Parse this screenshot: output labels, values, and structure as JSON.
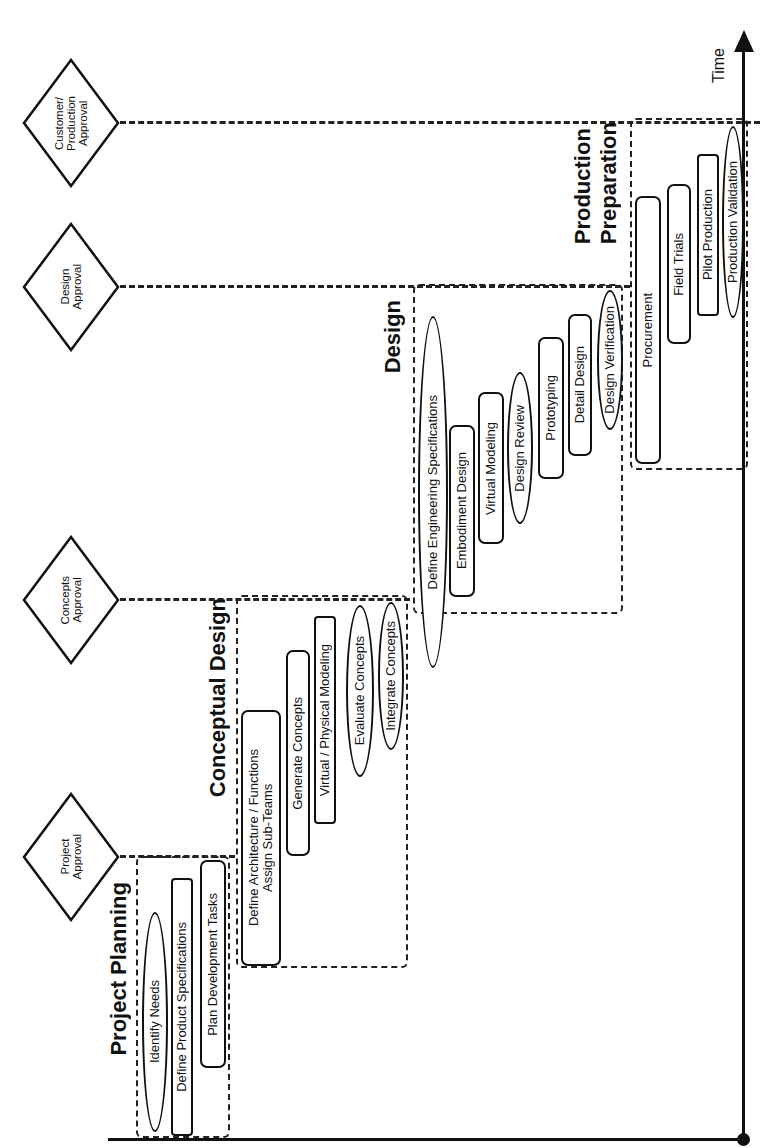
{
  "diagram": {
    "orientation": "rotated 90 degrees counter-clockwise; time flows bottom to top",
    "axis": {
      "label": "Time"
    },
    "gates": [
      {
        "id": "project-approval",
        "label_lines": [
          "Project",
          "Approval"
        ]
      },
      {
        "id": "concepts-approval",
        "label_lines": [
          "Concepts",
          "Approval"
        ]
      },
      {
        "id": "design-approval",
        "label_lines": [
          "Design",
          "Approval"
        ]
      },
      {
        "id": "customer-production-approval",
        "label_lines": [
          "Customer/",
          "Production",
          "Approval"
        ]
      }
    ],
    "phases": [
      {
        "title": "Project Planning",
        "tasks": [
          {
            "label": "Identify Needs",
            "shape": "oval"
          },
          {
            "label": "Define Product Specifications",
            "shape": "rect"
          },
          {
            "label": "Plan Development Tasks",
            "shape": "rect"
          }
        ]
      },
      {
        "title": "Conceptual Design",
        "tasks": [
          {
            "label_lines": [
              "Define Architecture / Functions",
              "Assign Sub-Teams"
            ],
            "shape": "rect"
          },
          {
            "label": "Generate Concepts",
            "shape": "rect"
          },
          {
            "label": "Virtual / Physical Modeling",
            "shape": "rect"
          },
          {
            "label": "Evaluate Concepts",
            "shape": "oval"
          },
          {
            "label": "Integrate Concepts",
            "shape": "oval"
          }
        ]
      },
      {
        "title": "Design",
        "tasks": [
          {
            "label": "Define Engineering Specifications",
            "shape": "oval"
          },
          {
            "label": "Embodiment Design",
            "shape": "rect"
          },
          {
            "label": "Virtual Modeling",
            "shape": "rect"
          },
          {
            "label": "Design Review",
            "shape": "oval"
          },
          {
            "label": "Prototyping",
            "shape": "rect"
          },
          {
            "label": "Detail Design",
            "shape": "rect"
          },
          {
            "label": "Design Verification",
            "shape": "oval"
          }
        ]
      },
      {
        "title_lines": [
          "Production",
          "Preparation"
        ],
        "tasks": [
          {
            "label": "Procurement",
            "shape": "rect"
          },
          {
            "label": "Field Trials",
            "shape": "rect"
          },
          {
            "label": "Pilot Production",
            "shape": "rect"
          },
          {
            "label": "Production Validation",
            "shape": "oval"
          }
        ]
      }
    ]
  }
}
